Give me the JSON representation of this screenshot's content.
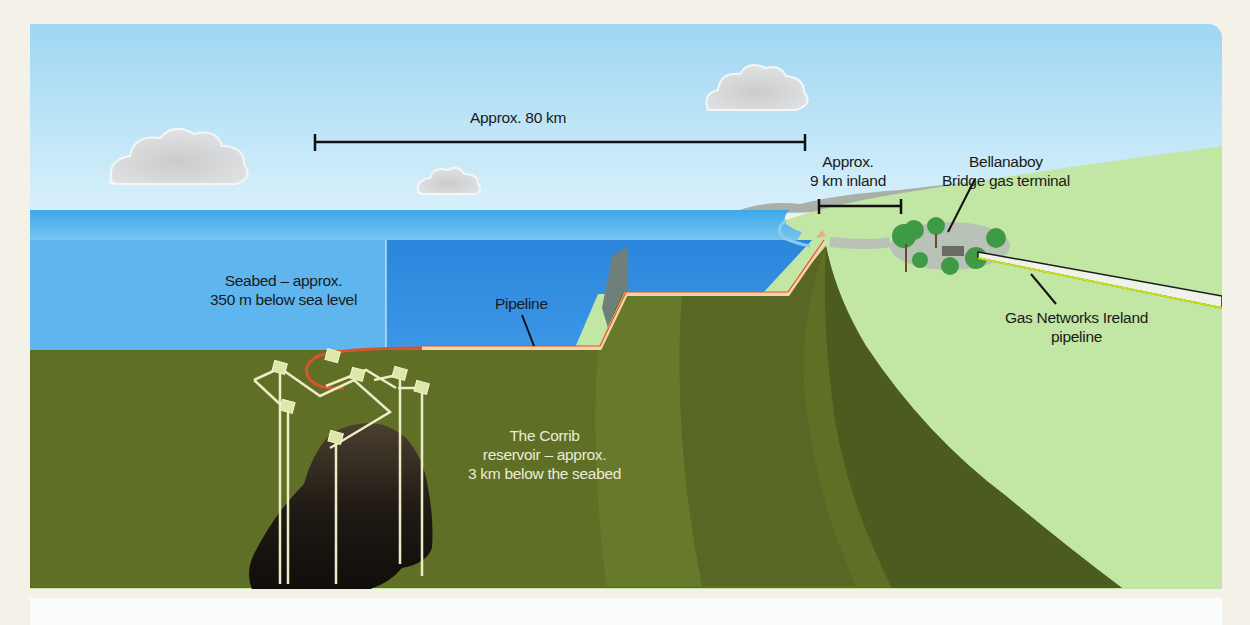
{
  "diagram": {
    "labels": {
      "offshore_distance": "Approx. 80 km",
      "inland_distance_line1": "Approx.",
      "inland_distance_line2": "9 km inland",
      "terminal_line1": "Bellanaboy",
      "terminal_line2": "Bridge gas terminal",
      "seabed_line1": "Seabed – approx.",
      "seabed_line2": "350 m below sea level",
      "pipeline": "Pipeline",
      "reservoir_line1": "The Corrib",
      "reservoir_line2": "reservoir – approx.",
      "reservoir_line3": "3 km below the seabed",
      "gni_line1": "Gas Networks Ireland",
      "gni_line2": "pipeline"
    },
    "colors": {
      "sky": "#a9dcf3",
      "sea_surface": "#4ab0ea",
      "sea_deep": "#2a7fd6",
      "seabed": "#5e6e26",
      "land": "#bfe6a0",
      "pipeline": "#f0c9a0",
      "pipeline_red": "#d9542a",
      "reservoir": "#1a1410",
      "wells": "#f2f0c8"
    }
  }
}
